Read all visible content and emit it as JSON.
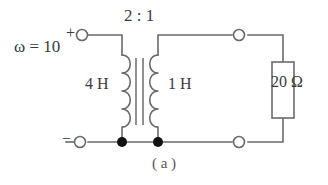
{
  "figure": {
    "caption": "( a )",
    "background_color": "#ffffff",
    "line_color": "#6a6a6a",
    "text_color": "#3a3a3a",
    "node_color": "#111111"
  },
  "source": {
    "frequency_label": "ω = 10",
    "plus_terminal_label": "+",
    "minus_terminal_label": "−"
  },
  "transformer": {
    "turns_ratio_label": "2 : 1",
    "primary_inductance_label": "4 H",
    "secondary_inductance_label": "1 H",
    "core_type": "iron-core",
    "core_line_count": 2,
    "primary_coil_bumps": 4,
    "secondary_coil_bumps": 4
  },
  "load": {
    "resistor_label": "20 Ω",
    "resistor_style": "rectangular"
  },
  "terminals": {
    "open_count": 4,
    "junction_dot_count": 2,
    "names": [
      "input-positive-terminal",
      "input-negative-terminal",
      "output-top-terminal",
      "output-bottom-terminal"
    ]
  },
  "icons": {
    "open_terminal": "open-circle-terminal-icon",
    "junction": "junction-dot-icon",
    "coil": "coil-icon",
    "core": "transformer-core-icon",
    "resistor": "resistor-box-icon"
  }
}
